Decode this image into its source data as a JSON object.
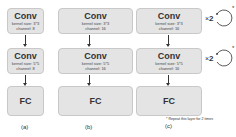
{
  "diagram": {
    "panels": [
      {
        "id": "a",
        "caption": "(a)",
        "layers": [
          {
            "title": "Conv",
            "kernel": "kernel size: 3*3",
            "channel": "channel: 8"
          },
          {
            "title": "Conv",
            "kernel": "kernel size: 5*5",
            "channel": "channel: 8"
          },
          {
            "title": "FC"
          }
        ]
      },
      {
        "id": "b",
        "caption": "(b)",
        "layers": [
          {
            "title": "Conv",
            "kernel": "kernel size: 3*3",
            "channel": "channel: 16"
          },
          {
            "title": "Conv",
            "kernel": "kernel size: 5*5",
            "channel": "channel: 16"
          },
          {
            "title": "FC"
          }
        ]
      },
      {
        "id": "c",
        "caption": "(c)",
        "layers": [
          {
            "title": "Conv",
            "kernel": "kernel size: 3*3",
            "channel": "channel: 16",
            "repeat": "2",
            "repeat_symbol": "×",
            "star": "*"
          },
          {
            "title": "Conv",
            "kernel": "kernel size: 5*5",
            "channel": "channel: 16",
            "repeat": "2",
            "repeat_symbol": "×",
            "star": "*"
          },
          {
            "title": "FC"
          }
        ]
      }
    ],
    "footnote": "* Repeat this layer for 2 times"
  },
  "colors": {
    "box_fill": "#e4e4e4",
    "box_border": "#c8c8c8",
    "text": "#333333"
  }
}
